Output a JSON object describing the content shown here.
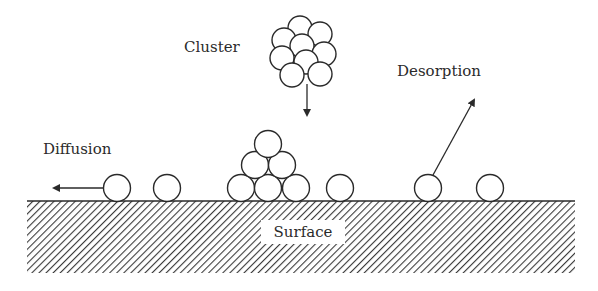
{
  "diagram": {
    "type": "surface processes schematic",
    "labels": {
      "cluster": "Cluster",
      "desorption": "Desorption",
      "diffusion": "Diffusion",
      "surface": "Surface"
    },
    "colors": {
      "stroke": "#2a2a2a",
      "background": "#ffffff",
      "hatch": "#3a3a3a"
    },
    "surface": {
      "x": 27,
      "y": 201,
      "width": 548,
      "height": 72
    },
    "atoms": {
      "radius": 13.5,
      "diffusing": [
        {
          "cx": 117,
          "cy": 188
        }
      ],
      "adsorbed": [
        {
          "cx": 167,
          "cy": 188
        },
        {
          "cx": 340,
          "cy": 188
        },
        {
          "cx": 490,
          "cy": 188
        }
      ],
      "desorbing": [
        {
          "cx": 428,
          "cy": 188
        }
      ],
      "pyramid": [
        {
          "cx": 241,
          "cy": 188
        },
        {
          "cx": 268,
          "cy": 188
        },
        {
          "cx": 296,
          "cy": 188
        },
        {
          "cx": 255,
          "cy": 165
        },
        {
          "cx": 282,
          "cy": 165
        },
        {
          "cx": 268,
          "cy": 144
        }
      ],
      "cluster": [
        {
          "cx": 300,
          "cy": 28
        },
        {
          "cx": 320,
          "cy": 34
        },
        {
          "cx": 284,
          "cy": 40
        },
        {
          "cx": 302,
          "cy": 46
        },
        {
          "cx": 282,
          "cy": 58
        },
        {
          "cx": 324,
          "cy": 54
        },
        {
          "cx": 306,
          "cy": 62
        },
        {
          "cx": 292,
          "cy": 75
        },
        {
          "cx": 320,
          "cy": 74
        }
      ]
    },
    "arrows": {
      "diffusion": {
        "x1": 103,
        "y1": 188,
        "x2": 54,
        "y2": 188
      },
      "cluster_deposition": {
        "x1": 307,
        "y1": 84,
        "x2": 307,
        "y2": 115
      },
      "desorption": {
        "x1": 433,
        "y1": 175,
        "x2": 474,
        "y2": 100
      }
    }
  }
}
